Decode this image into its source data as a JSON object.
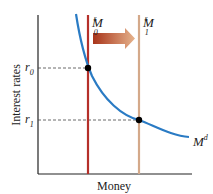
{
  "diagram": {
    "title": "",
    "x_axis_label": "Money",
    "y_axis_label": "Interest rates",
    "supply_initial": {
      "label": "M",
      "sup": "s",
      "sub": "0",
      "color": "#b5302a"
    },
    "supply_new": {
      "label": "M",
      "sup": "s",
      "sub": "1",
      "color": "#d4a98a"
    },
    "demand": {
      "label": "M",
      "sup": "d",
      "color": "#2a7bc4"
    },
    "rate_initial": {
      "label": "r",
      "sub": "0"
    },
    "rate_new": {
      "label": "r",
      "sub": "1"
    },
    "arrow": {
      "direction": "right",
      "color_start": "#b0401a",
      "color_end": "#e8b48a"
    }
  }
}
